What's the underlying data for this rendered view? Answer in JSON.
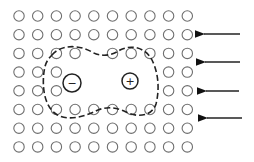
{
  "diagram": {
    "lattice": {
      "cols": 10,
      "rows": 8,
      "x0": 19,
      "y0": 16,
      "dx": 18.7,
      "dy": 18.7,
      "radius": 5.2,
      "stroke": "#6f6f6f",
      "missing": [
        [
          2,
          4
        ],
        [
          3,
          3
        ],
        [
          3,
          4
        ],
        [
          3,
          5
        ],
        [
          3,
          6
        ],
        [
          3,
          7
        ],
        [
          4,
          3
        ],
        [
          4,
          4
        ],
        [
          4,
          5
        ],
        [
          4,
          6
        ],
        [
          4,
          7
        ]
      ]
    },
    "ions": [
      {
        "sign": "−",
        "x": 72,
        "y": 83,
        "r": 9
      },
      {
        "sign": "+",
        "x": 130,
        "y": 81,
        "r": 8
      }
    ],
    "boundary": {
      "style": "dashed",
      "path": "M52,55 C60,45 78,44 92,52 C100,57 112,56 120,50 C132,44 146,48 152,60 C158,72 160,88 156,104 C152,116 138,118 126,112 C118,108 108,106 98,110 C86,116 68,122 56,114 C44,106 42,86 44,72 C45,64 47,60 52,55 Z"
    },
    "arrows": [
      {
        "x1": 240,
        "x2": 198,
        "y": 34
      },
      {
        "x1": 240,
        "x2": 199,
        "y": 62
      },
      {
        "x1": 239,
        "x2": 200,
        "y": 91
      },
      {
        "x1": 242,
        "x2": 201,
        "y": 118
      }
    ]
  }
}
